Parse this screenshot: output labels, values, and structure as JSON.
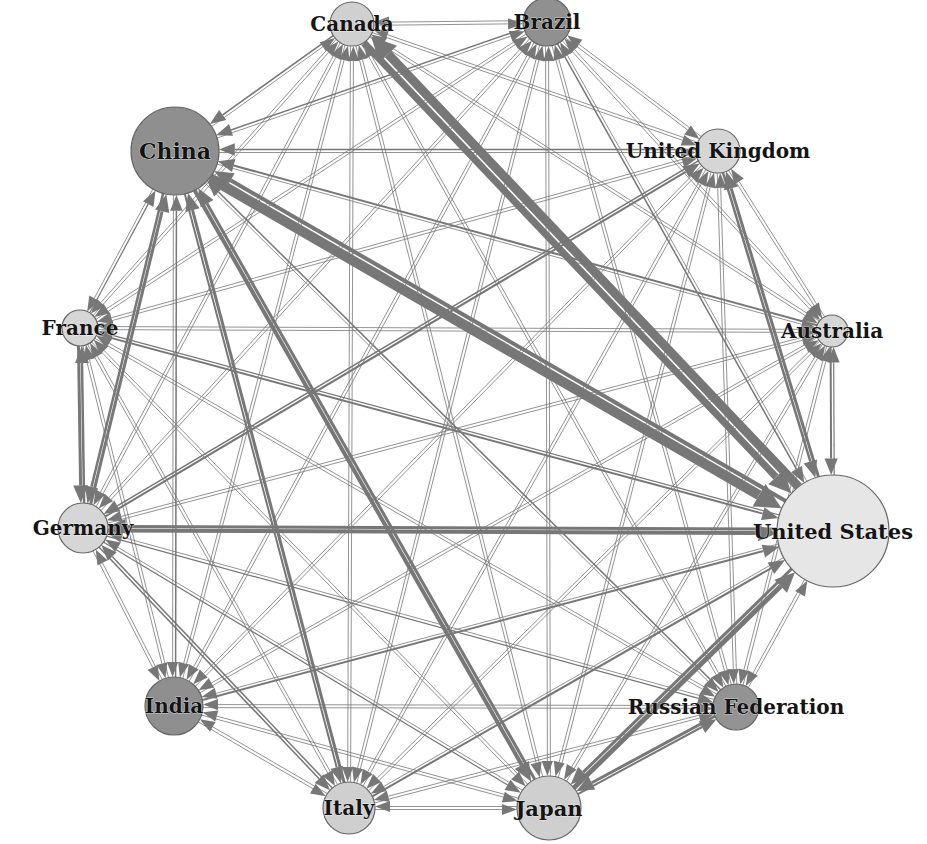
{
  "diagram": {
    "type": "directed-network",
    "layout": "circular",
    "colors": {
      "edge": "#777777",
      "node_border": "#666666",
      "node_light": "#e2e2e2",
      "node_mid": "#cccccc",
      "node_dark": "#8f8f8f",
      "label": "#141414",
      "background": "#ffffff"
    },
    "nodes": [
      {
        "id": "canada",
        "label": "Canada",
        "x": 352,
        "y": 24,
        "r": 22,
        "fill": "#d0d0d0",
        "font": 20
      },
      {
        "id": "brazil",
        "label": "Brazil",
        "x": 547,
        "y": 22,
        "r": 24,
        "fill": "#909090",
        "font": 20
      },
      {
        "id": "united-kingdom",
        "label": "United Kingdom",
        "x": 718,
        "y": 151,
        "r": 22,
        "fill": "#d6d6d6",
        "font": 20
      },
      {
        "id": "australia",
        "label": "Australia",
        "x": 832,
        "y": 331,
        "r": 16,
        "fill": "#d6d6d6",
        "font": 20
      },
      {
        "id": "united-states",
        "label": "United States",
        "x": 833,
        "y": 531,
        "r": 56,
        "fill": "#e6e6e6",
        "font": 21
      },
      {
        "id": "russian-federation",
        "label": "Russian Federation",
        "x": 736,
        "y": 707,
        "r": 23,
        "fill": "#939393",
        "font": 20
      },
      {
        "id": "japan",
        "label": "Japan",
        "x": 549,
        "y": 808,
        "r": 32,
        "fill": "#cfcfcf",
        "font": 21
      },
      {
        "id": "italy",
        "label": "Italy",
        "x": 349,
        "y": 808,
        "r": 26,
        "fill": "#cfcfcf",
        "font": 20
      },
      {
        "id": "india",
        "label": "India",
        "x": 174,
        "y": 706,
        "r": 29,
        "fill": "#8f8f8f",
        "font": 20
      },
      {
        "id": "germany",
        "label": "Germany",
        "x": 83,
        "y": 528,
        "r": 25,
        "fill": "#d6d6d6",
        "font": 20
      },
      {
        "id": "france",
        "label": "France",
        "x": 80,
        "y": 328,
        "r": 18,
        "fill": "#d6d6d6",
        "font": 20
      },
      {
        "id": "china",
        "label": "China",
        "x": 175,
        "y": 151,
        "r": 44,
        "fill": "#8f8f8f",
        "font": 22
      }
    ],
    "edges": [
      {
        "from": "china",
        "to": "united-states",
        "weight": 10
      },
      {
        "from": "united-states",
        "to": "canada",
        "weight": 9
      },
      {
        "from": "canada",
        "to": "united-states",
        "weight": 7
      },
      {
        "from": "united-states",
        "to": "china",
        "weight": 4
      },
      {
        "from": "germany",
        "to": "united-states",
        "weight": 4
      },
      {
        "from": "united-states",
        "to": "germany",
        "weight": 3
      },
      {
        "from": "japan",
        "to": "united-states",
        "weight": 5
      },
      {
        "from": "united-states",
        "to": "japan",
        "weight": 3
      },
      {
        "from": "china",
        "to": "japan",
        "weight": 4
      },
      {
        "from": "japan",
        "to": "china",
        "weight": 3
      },
      {
        "from": "united-states",
        "to": "united-kingdom",
        "weight": 3
      },
      {
        "from": "united-kingdom",
        "to": "united-states",
        "weight": 2.5
      },
      {
        "from": "germany",
        "to": "china",
        "weight": 3
      },
      {
        "from": "china",
        "to": "germany",
        "weight": 2.5
      },
      {
        "from": "russian-federation",
        "to": "japan",
        "weight": 3
      },
      {
        "from": "japan",
        "to": "russian-federation",
        "weight": 2
      },
      {
        "from": "france",
        "to": "germany",
        "weight": 3
      },
      {
        "from": "germany",
        "to": "france",
        "weight": 2.5
      },
      {
        "from": "italy",
        "to": "china",
        "weight": 3
      },
      {
        "from": "china",
        "to": "italy",
        "weight": 2
      },
      {
        "from": "australia",
        "to": "united-states",
        "weight": 2
      },
      {
        "from": "australia",
        "to": "china",
        "weight": 2
      },
      {
        "from": "germany",
        "to": "united-kingdom",
        "weight": 2
      },
      {
        "from": "united-kingdom",
        "to": "germany",
        "weight": 1.5
      },
      {
        "from": "france",
        "to": "united-states",
        "weight": 2
      },
      {
        "from": "italy",
        "to": "united-states",
        "weight": 2
      },
      {
        "from": "india",
        "to": "united-states",
        "weight": 2
      },
      {
        "from": "brazil",
        "to": "united-states",
        "weight": 1.5
      },
      {
        "from": "russian-federation",
        "to": "china",
        "weight": 1.5
      },
      {
        "from": "united-kingdom",
        "to": "china",
        "weight": 1.5
      },
      {
        "from": "india",
        "to": "china",
        "weight": 1.5
      },
      {
        "from": "brazil",
        "to": "china",
        "weight": 1.5
      },
      {
        "from": "canada",
        "to": "china",
        "weight": 1.5
      },
      {
        "from": "germany",
        "to": "italy",
        "weight": 1.5
      },
      {
        "from": "italy",
        "to": "germany",
        "weight": 1.5
      },
      {
        "from": "germany",
        "to": "japan",
        "weight": 1.2
      },
      {
        "from": "france",
        "to": "china",
        "weight": 1.2
      },
      {
        "from": "germany",
        "to": "russian-federation",
        "weight": 1.2
      },
      {
        "from": "united-states",
        "to": "france",
        "weight": 1.2
      },
      {
        "from": "united-states",
        "to": "australia",
        "weight": 1.2
      }
    ]
  }
}
